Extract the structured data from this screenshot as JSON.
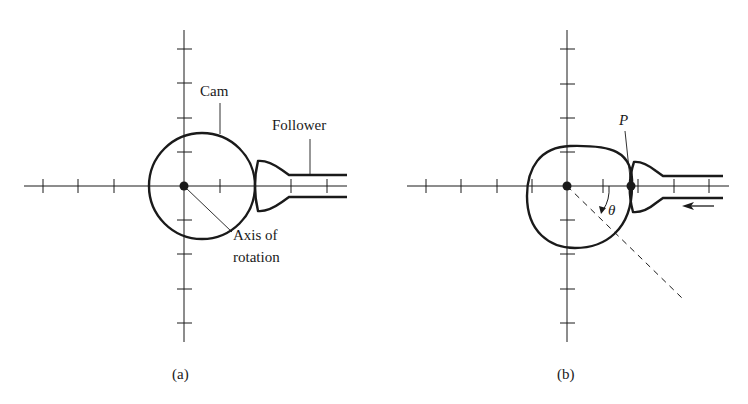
{
  "figure": {
    "panels": [
      {
        "id": "a",
        "caption": "(a)",
        "labels": {
          "cam": "Cam",
          "follower": "Follower",
          "axis_line1": "Axis of",
          "axis_line2": "rotation"
        }
      },
      {
        "id": "b",
        "caption": "(b)",
        "labels": {
          "point": "P",
          "angle": "θ"
        }
      }
    ],
    "colors": {
      "ink": "#1a1a1a",
      "background": "#ffffff"
    }
  }
}
